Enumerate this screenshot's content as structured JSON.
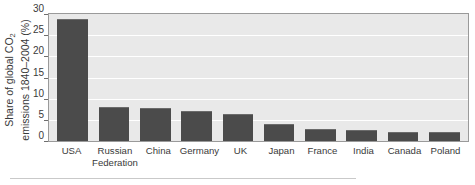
{
  "chart_data": {
    "type": "bar",
    "title": "",
    "subtitle": "",
    "xlabel": "",
    "ylabel": "Share of global CO2 emissions 1840-2004 (%)",
    "ylabel_line1_pre": "Share of global CO",
    "ylabel_line1_sub": "2",
    "ylabel_line2": "emissions 1840–2004 (%)",
    "categories": [
      "USA",
      "Russian Federation",
      "China",
      "Germany",
      "UK",
      "Japan",
      "France",
      "India",
      "Canada",
      "Poland"
    ],
    "category_lines": [
      [
        "USA"
      ],
      [
        "Russian",
        "Federation"
      ],
      [
        "China"
      ],
      [
        "Germany"
      ],
      [
        "UK"
      ],
      [
        "Japan"
      ],
      [
        "France"
      ],
      [
        "India"
      ],
      [
        "Canada"
      ],
      [
        "Poland"
      ]
    ],
    "values": [
      28.8,
      8.0,
      7.9,
      7.0,
      6.4,
      4.1,
      2.9,
      2.5,
      2.2,
      2.1
    ],
    "yticks": [
      0,
      5,
      10,
      15,
      20,
      25,
      30
    ],
    "ytick_labels": [
      "0",
      "5",
      "10",
      "15",
      "20",
      "25",
      "30"
    ],
    "ylim": [
      0,
      30
    ],
    "grid": true,
    "legend": "none",
    "orientation": "vertical",
    "bar_color": "#4b4b4b",
    "plot_background": "#e9e9e9",
    "gridline_color": "#ffffff",
    "axis_color": "#6e6e6e"
  }
}
